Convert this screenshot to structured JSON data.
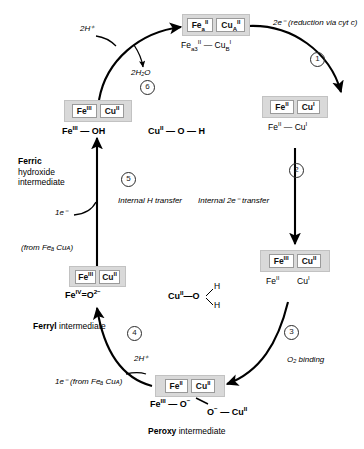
{
  "diagram": {
    "accent": "#000000",
    "box_fill": "#d9d9d9",
    "cell_fill": "#ffffff"
  },
  "states": {
    "oxidized_top": {
      "cells": [
        "Feᵃₒᴵᴵ",
        "Cuᴬᴵᴵ"
      ],
      "cell_fe_base": "Fe",
      "cell_fe_sub": "a",
      "cell_fe_sup": "II",
      "cell_cu_base": "Cu",
      "cell_cu_sub": "A",
      "cell_cu_sup": "II",
      "formula_fe_base": "Fe",
      "formula_fe_sub": "a3",
      "formula_fe_sup": "II",
      "formula_bond": "—",
      "formula_cu_base": "Cu",
      "formula_cu_sub": "B",
      "formula_cu_sup": "I"
    },
    "reduced_right": {
      "cell_fe": "Fe",
      "cell_fe_sup": "II",
      "cell_cu": "Cu",
      "cell_cu_sup": "I",
      "formula_fe": "Fe",
      "formula_fe_sup": "II",
      "formula_bond": "—",
      "formula_cu": "Cu",
      "formula_cu_sup": "I"
    },
    "oxidized_right_mid": {
      "cell_fe": "Fe",
      "cell_fe_sup": "III",
      "cell_cu": "Cu",
      "cell_cu_sup": "II",
      "formula_fe": "Fe",
      "formula_fe_sup": "II",
      "formula_cu": "Cu",
      "formula_cu_sup": "I"
    },
    "peroxy_bottom": {
      "cell_fe": "Fe",
      "cell_fe_sup": "II",
      "cell_cu": "Cu",
      "cell_cu_sup": "II",
      "formula_fe": "Fe",
      "formula_fe_sup": "III",
      "formula_bond1": "—",
      "formula_o1": "O",
      "formula_o1_sup": "−",
      "formula_o2": "O",
      "formula_o2_sup": "−",
      "formula_bond2": "—",
      "formula_cu": "Cu",
      "formula_cu_sup": "II",
      "label_bold": "Peroxy",
      "label_rest": " intermediate"
    },
    "ferryl_left": {
      "cell_fe": "Fe",
      "cell_fe_sup": "III",
      "cell_cu": "Cu",
      "cell_cu_sup": "II",
      "formula_fe": "Fe",
      "formula_fe_sup": "IV",
      "formula_bond": "=",
      "formula_o": "O",
      "formula_o_sup": "2−",
      "water_cu": "Cu",
      "water_cu_sup": "II",
      "water_bond": "—",
      "water_o": "O",
      "water_h1": "H",
      "water_h2": "H",
      "label_bold": "Ferryl",
      "label_rest": " intermediate"
    },
    "ferric_hydroxide_left": {
      "cell_fe": "Fe",
      "cell_fe_sup": "III",
      "cell_cu": "Cu",
      "cell_cu_sup": "II",
      "formula_fe": "Fe",
      "formula_fe_sup": "III",
      "formula_bond": "—",
      "formula_oh": "OH",
      "formula_cu": "Cu",
      "formula_cu_sup": "II",
      "formula_cu_bond1": "—",
      "formula_cu_o": "O",
      "formula_cu_bond2": "—",
      "formula_cu_h": "H",
      "label_bold": "Ferric",
      "label_line2": "hydroxide",
      "label_line3": "intermediate"
    }
  },
  "steps": [
    {
      "number": "①",
      "label": "2e⁻ (reduction via cyt  c)"
    },
    {
      "number": "②",
      "label": "Internal 2e⁻  transfer"
    },
    {
      "number": "③",
      "label": "O₂ binding"
    },
    {
      "number": "④",
      "label": "2H⁺"
    },
    {
      "number": "⑤",
      "label": "Internal H transfer"
    },
    {
      "number": "⑥",
      "label": "2H₂O"
    }
  ],
  "annotations": {
    "two_h_plus_top": "2H⁺",
    "two_water": "2H₂O",
    "one_electron_step5": "1e⁻",
    "from_source_step5": "(from Feₐ Cuᴀ)",
    "one_electron_step4": "1e⁻ (from Feₐ Cuᴀ)",
    "two_h_plus_step4": "2H⁺",
    "step1_label": "2e⁻ (reduction via cyt  c)",
    "step2_label": "Internal 2e⁻  transfer",
    "step3_label": "O₂ binding",
    "step5_label": "Internal H transfer",
    "step1_num": "1",
    "step2_num": "2",
    "step3_num": "3",
    "step4_num": "4",
    "step5_num": "5",
    "step6_num": "6"
  }
}
